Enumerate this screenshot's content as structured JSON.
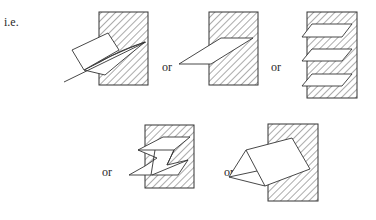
{
  "intro_label": "i.e.",
  "separator_label": "or",
  "figures": [
    {
      "id": 1,
      "description": "block with wedge-shaped slot holding a tilted rectangular plate and a long line"
    },
    {
      "id": 2,
      "description": "block with a single parallelogram insert penetrating from the left"
    },
    {
      "id": 3,
      "description": "block with three stacked parallelogram inserts"
    },
    {
      "id": 4,
      "description": "block with Z-shaped folded plate insert"
    },
    {
      "id": 5,
      "description": "block with triangular prism insert"
    }
  ],
  "labels": {
    "ie": "i.e.",
    "or1": "or",
    "or2": "or",
    "or3": "or",
    "or4": "or"
  },
  "colors": {
    "line": "#333333",
    "background": "#ffffff"
  }
}
